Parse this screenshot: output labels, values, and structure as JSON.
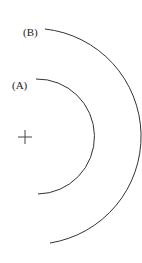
{
  "diagram": {
    "labels": {
      "a": "(A)",
      "b": "(B)"
    },
    "center_mark": "+",
    "colors": {
      "stroke": "#333333",
      "background": "#ffffff"
    },
    "arcs": [
      {
        "id": "A",
        "cx": 25,
        "cy": 137,
        "r": 57
      },
      {
        "id": "B",
        "cx": 24,
        "cy": 137,
        "r": 108
      }
    ]
  }
}
